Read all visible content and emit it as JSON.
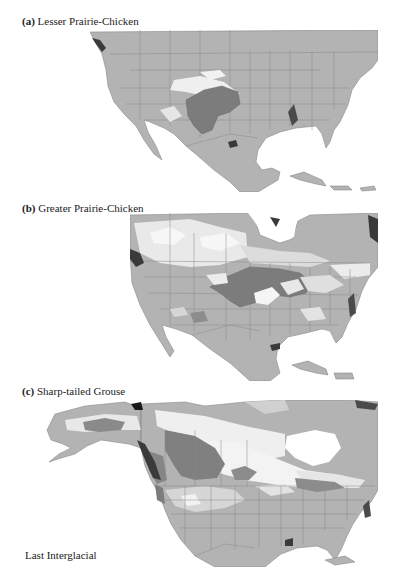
{
  "figure": {
    "panels": [
      {
        "letter": "(a)",
        "title": "Lesser Prairie-Chicken"
      },
      {
        "letter": "(b)",
        "title": "Greater Prairie-Chicken"
      },
      {
        "letter": "(c)",
        "title": "Sharp-tailed Grouse"
      }
    ],
    "period_label": "Last Interglacial"
  },
  "colors": {
    "land": "#b3b3b3",
    "border": "#8a8a8a",
    "range": "#7c7c7c",
    "suitable_high": "#f2f2f2",
    "suitable_mid": "#d6d6d6",
    "coast_dark": "#3a3a3a",
    "ocean": "#ffffff"
  }
}
